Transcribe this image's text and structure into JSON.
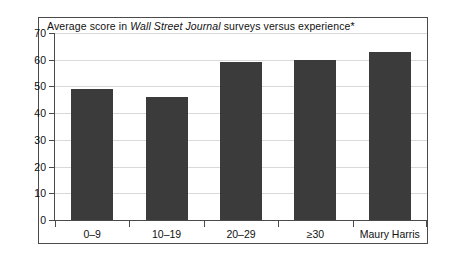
{
  "chart_data": {
    "type": "bar",
    "title": "Average score in Wall Street Journal surveys versus experience*",
    "title_parts": {
      "before": "Average score in ",
      "italic": "Wall Street Journal",
      "after": " surveys versus experience*"
    },
    "categories": [
      "0–9",
      "10–19",
      "20–29",
      "≥30",
      "Maury Harris"
    ],
    "values": [
      49,
      46,
      59,
      60,
      63
    ],
    "xlabel": "",
    "ylabel": "",
    "ylim": [
      0,
      70
    ],
    "ytick_step": 10,
    "yticks": [
      70,
      60,
      50,
      40,
      30,
      20,
      10,
      0
    ],
    "ytick_labels": [
      "70",
      "60",
      "50",
      "40",
      "30",
      "20",
      "10",
      "0"
    ],
    "grid": true,
    "legend": false,
    "series": [
      {
        "name": "Average score",
        "values": [
          49,
          46,
          59,
          60,
          63
        ]
      }
    ],
    "colors": {
      "bar_fill": "#3b3b3b",
      "gridline": "#d9d9d9",
      "axis": "#4a4a4a",
      "frame": "#4a4a4a",
      "text": "#111111",
      "background": "#ffffff"
    }
  }
}
